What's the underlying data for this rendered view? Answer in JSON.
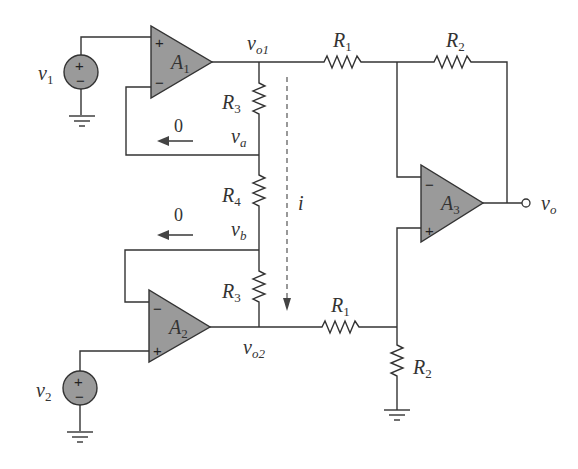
{
  "diagram": {
    "type": "circuit-schematic",
    "opamps": [
      {
        "id": "A1",
        "name": "A",
        "sub": "1",
        "plus": "+",
        "minus": "−"
      },
      {
        "id": "A2",
        "name": "A",
        "sub": "2",
        "plus": "+",
        "minus": "−"
      },
      {
        "id": "A3",
        "name": "A",
        "sub": "3",
        "plus": "+",
        "minus": "−"
      }
    ],
    "sources": [
      {
        "id": "v1",
        "name": "v",
        "sub": "1",
        "plus": "+",
        "minus": "−"
      },
      {
        "id": "v2",
        "name": "v",
        "sub": "2",
        "plus": "+",
        "minus": "−"
      }
    ],
    "resistors": {
      "r1_top": {
        "name": "R",
        "sub": "1"
      },
      "r2_top": {
        "name": "R",
        "sub": "2"
      },
      "r3_top": {
        "name": "R",
        "sub": "3"
      },
      "r4": {
        "name": "R",
        "sub": "4"
      },
      "r3_bottom": {
        "name": "R",
        "sub": "3"
      },
      "r1_bottom": {
        "name": "R",
        "sub": "1"
      },
      "r2_bottom": {
        "name": "R",
        "sub": "2"
      }
    },
    "nodes": {
      "vo1": {
        "name": "v",
        "sub": "o1"
      },
      "vo2": {
        "name": "v",
        "sub": "o2"
      },
      "va": {
        "name": "v",
        "sub": "a"
      },
      "vb": {
        "name": "v",
        "sub": "b"
      },
      "vo": {
        "name": "v",
        "sub": "o"
      }
    },
    "currents": {
      "i": "i",
      "zero_top": "0",
      "zero_bottom": "0"
    }
  }
}
